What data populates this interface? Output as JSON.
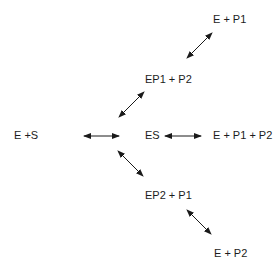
{
  "diagram": {
    "nodes": [
      {
        "id": "e_s",
        "label": "E +S"
      },
      {
        "id": "es",
        "label": "ES"
      },
      {
        "id": "ep1_p2",
        "label": "EP1 + P2"
      },
      {
        "id": "e_p1",
        "label": "E + P1"
      },
      {
        "id": "e_p1_p2",
        "label": "E + P1 + P2"
      },
      {
        "id": "ep2_p1",
        "label": "EP2 + P1"
      },
      {
        "id": "e_p2",
        "label": "E + P2"
      }
    ],
    "edges": [
      {
        "from": "e_s",
        "to": "es",
        "type": "bidirectional"
      },
      {
        "from": "es",
        "to": "e_p1_p2",
        "type": "bidirectional"
      },
      {
        "from": "es",
        "to": "ep1_p2",
        "type": "bidirectional"
      },
      {
        "from": "ep1_p2",
        "to": "e_p1",
        "type": "bidirectional"
      },
      {
        "from": "es",
        "to": "ep2_p1",
        "type": "bidirectional"
      },
      {
        "from": "ep2_p1",
        "to": "e_p2",
        "type": "bidirectional"
      }
    ],
    "colors": {
      "line": "#1a1a1a",
      "background": "#ffffff"
    }
  }
}
